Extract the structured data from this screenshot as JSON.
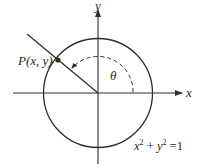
{
  "diagram": {
    "type": "unit-circle",
    "axes": {
      "x_label": "x",
      "y_label": "y"
    },
    "point": {
      "label": "P(x, y)"
    },
    "angle": {
      "label": "θ"
    },
    "equation": {
      "x": "x",
      "x_exp": "2",
      "plus": "+",
      "y": "y",
      "y_exp": "2",
      "eq": "=",
      "rhs": "1"
    },
    "colors": {
      "stroke": "#2e2e2e",
      "background": "#ffffff"
    }
  }
}
